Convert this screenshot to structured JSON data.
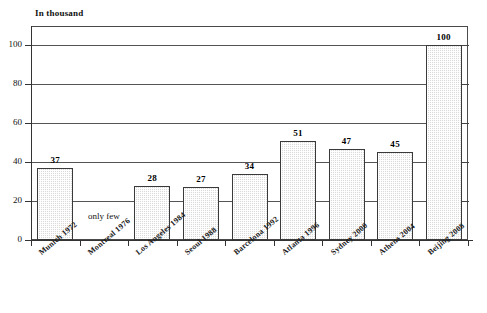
{
  "chart_data": {
    "type": "bar",
    "title": "",
    "subtitle": "",
    "axis_note": "In thousand",
    "xlabel": "",
    "ylabel": "In thousand",
    "ylim": [
      0,
      110
    ],
    "yticks": [
      0,
      20,
      40,
      60,
      80,
      100
    ],
    "grid": true,
    "gridlines_at": [
      20,
      40,
      60,
      80,
      100
    ],
    "legend": "none",
    "categories": [
      "Munich 1972",
      "Montreal 1976",
      "Los Angeles 1984",
      "Seoul 1988",
      "Barcelona 1992",
      "Atlanta 1996",
      "Sydney 2000",
      "Athens 2004",
      "Beijing 2008"
    ],
    "values": [
      37,
      null,
      28,
      27,
      34,
      51,
      47,
      45,
      100
    ],
    "value_labels": [
      "37",
      "",
      "28",
      "27",
      "34",
      "51",
      "47",
      "45",
      "100"
    ],
    "annotations": [
      {
        "category": "Montreal 1976",
        "text": "only few"
      }
    ],
    "colors": {
      "bar_fill": "#d9d9d9",
      "bar_edge": "#3a3a3a",
      "axis": "#333333",
      "grid": "#555555",
      "text": "#111111",
      "background": "#ffffff"
    }
  },
  "ytick_labels": [
    "0",
    "20",
    "40",
    "60",
    "80",
    "100"
  ]
}
